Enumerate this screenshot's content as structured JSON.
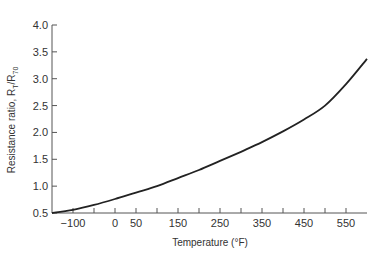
{
  "chart_data": {
    "type": "line",
    "title": "",
    "xlabel": "Temperature (°F)",
    "ylabel": "Resistance ratio, R_T/R_70",
    "ylabel_main": "Resistance ratio, R",
    "ylabel_sub1": "T",
    "ylabel_mid": "/R",
    "ylabel_sub2": "70",
    "xlim": [
      -150,
      600
    ],
    "ylim": [
      0.5,
      4.0
    ],
    "grid": false,
    "legend": null,
    "x_ticks": [
      -150,
      -100,
      -50,
      0,
      50,
      100,
      150,
      200,
      250,
      300,
      350,
      400,
      450,
      500,
      550
    ],
    "x_tick_labels": [
      {
        "value": -100,
        "label": "−100"
      },
      {
        "value": 0,
        "label": "0"
      },
      {
        "value": 50,
        "label": "50"
      },
      {
        "value": 150,
        "label": "150"
      },
      {
        "value": 250,
        "label": "250"
      },
      {
        "value": 350,
        "label": "350"
      },
      {
        "value": 450,
        "label": "450"
      },
      {
        "value": 550,
        "label": "550"
      }
    ],
    "y_ticks": [
      {
        "value": 0.5,
        "label": "0.5"
      },
      {
        "value": 1.0,
        "label": "1.0"
      },
      {
        "value": 1.5,
        "label": "1.5"
      },
      {
        "value": 2.0,
        "label": "2.0"
      },
      {
        "value": 2.5,
        "label": "2.5"
      },
      {
        "value": 3.0,
        "label": "3.0"
      },
      {
        "value": 3.5,
        "label": "3.5"
      },
      {
        "value": 4.0,
        "label": "4.0"
      }
    ],
    "series": [
      {
        "name": "Resistance ratio",
        "color": "#222222",
        "x": [
          -150,
          -100,
          -50,
          0,
          50,
          100,
          150,
          200,
          250,
          300,
          350,
          400,
          450,
          500,
          550,
          600
        ],
        "y": [
          0.5,
          0.56,
          0.65,
          0.76,
          0.88,
          1.0,
          1.15,
          1.3,
          1.47,
          1.64,
          1.82,
          2.02,
          2.24,
          2.5,
          2.9,
          3.37
        ]
      }
    ]
  }
}
